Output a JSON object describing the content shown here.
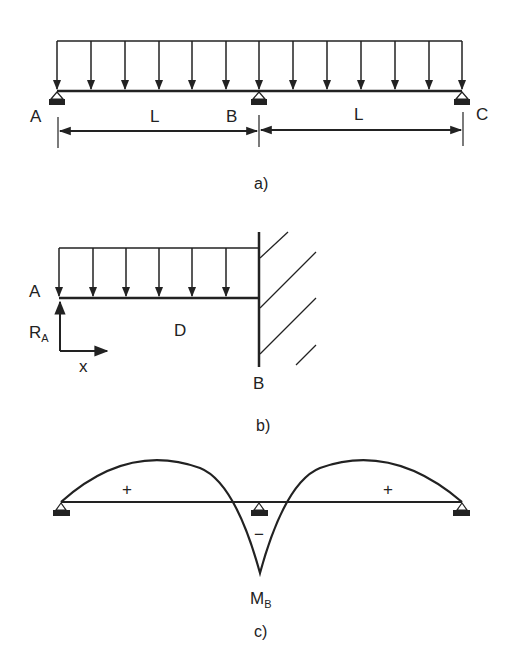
{
  "figure_a": {
    "caption": "a)",
    "labels": {
      "A": "A",
      "B": "B",
      "C": "C"
    },
    "spans": [
      {
        "label": "L"
      },
      {
        "label": "L"
      }
    ],
    "load": "uniform distributed load over two spans",
    "supports": [
      "A",
      "B",
      "C"
    ]
  },
  "figure_b": {
    "caption": "b)",
    "labels": {
      "A": "A",
      "B": "B",
      "D": "D",
      "x": "x",
      "reaction": "R",
      "reaction_sub": "A"
    },
    "load": "uniform distributed load, fixed wall at B"
  },
  "figure_c": {
    "caption": "c)",
    "moment_label": "M",
    "moment_sub": "B",
    "signs": {
      "left": "+",
      "middle": "−",
      "right": "+"
    }
  },
  "colors": {
    "ink": "#222222",
    "background": "#ffffff"
  }
}
